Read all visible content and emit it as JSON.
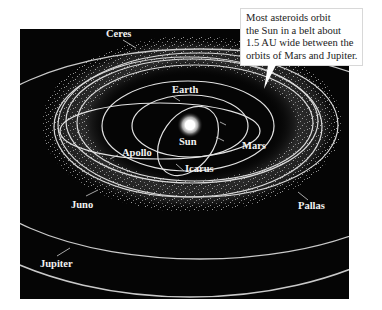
{
  "diagram": {
    "background_color": "#050505",
    "orbit_color": "#d9d9d9",
    "label_color": "#f2f2f2",
    "labels": {
      "ceres": "Ceres",
      "earth": "Earth",
      "sun": "Sun",
      "mars": "Mars",
      "apollo": "Apollo",
      "icarus": "Icarus",
      "juno": "Juno",
      "pallas": "Pallas",
      "jupiter": "Jupiter"
    },
    "callout": {
      "lines": [
        "Most asteroids orbit",
        "the Sun in a belt about",
        "1.5 AU wide between the",
        "orbits of Mars and Jupiter."
      ]
    }
  }
}
